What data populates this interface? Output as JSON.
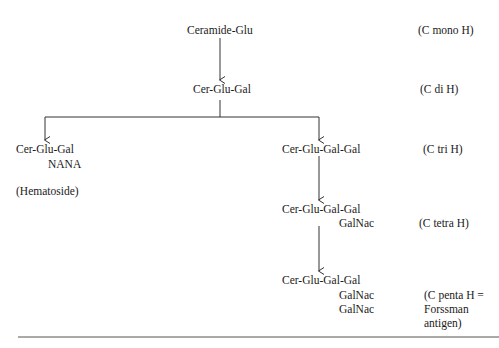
{
  "diagram": {
    "nodes": {
      "ceramide_glu": "Ceramide-Glu",
      "cer_glu_gal": "Cer-Glu-Gal",
      "hematoside_main": "Cer-Glu-Gal",
      "hematoside_sub": "NANA",
      "hematoside_name": "(Hematoside)",
      "tri": "Cer-Glu-Gal-Gal",
      "tetra_main": "Cer-Glu-Gal-Gal",
      "tetra_sub": "GalNac",
      "penta_main": "Cer-Glu-Gal-Gal",
      "penta_sub1": "GalNac",
      "penta_sub2": "GalNac"
    },
    "labels": {
      "mono": "(C mono H)",
      "di": "(C di H)",
      "tri": "(C tri H)",
      "tetra": "(C tetra H)",
      "penta_line1": "(C penta H =",
      "penta_line2": "Forssman",
      "penta_line3": "antigen)"
    },
    "colors": {
      "line": "#333333",
      "text": "#1a1a1a",
      "background": "#ffffff"
    }
  }
}
